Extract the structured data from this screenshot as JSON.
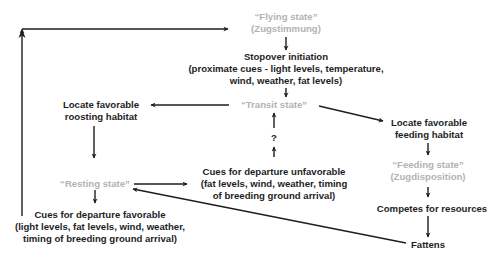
{
  "diagram": {
    "colors": {
      "text": "#1e1e1e",
      "state_text": "#b3b3b3",
      "arrow": "#1e1e1e",
      "background": "#ffffff"
    },
    "nodes": {
      "flying_state": {
        "line1": "“Flying state”",
        "line2": "(Zugstimmung)"
      },
      "stopover_initiation": {
        "line1": "Stopover initiation",
        "line2": "(proximate cues - light levels, temperature,",
        "line3": "wind, weather, fat levels)"
      },
      "transit_state": {
        "line1": "“Transit state”"
      },
      "question_mark": {
        "line1": "?"
      },
      "locate_roosting": {
        "line1": "Locate favorable",
        "line2": "roosting habitat"
      },
      "locate_feeding": {
        "line1": "Locate favorable",
        "line2": "feeding habitat"
      },
      "feeding_state": {
        "line1": "“Feeding state”",
        "line2": "(Zugdisposition)"
      },
      "resting_state": {
        "line1": "“Resting state”"
      },
      "cues_unfavorable": {
        "line1": "Cues for departure unfavorable",
        "line2": "(fat levels, wind, weather, timing",
        "line3": "of breeding ground arrival)"
      },
      "cues_favorable": {
        "line1": "Cues for departure favorable",
        "line2": "(light levels, fat levels, wind, weather,",
        "line3": "timing of breeding ground arrival)"
      },
      "competes": {
        "line1": "Competes for resources"
      },
      "fattens": {
        "line1": "Fattens"
      }
    },
    "edges": [
      {
        "from": "cues_favorable",
        "to": "flying_state",
        "route": "left-loop"
      },
      {
        "from": "flying_state",
        "to": "stopover_initiation"
      },
      {
        "from": "stopover_initiation",
        "to": "transit_state"
      },
      {
        "from": "transit_state",
        "to": "locate_roosting"
      },
      {
        "from": "transit_state",
        "to": "locate_feeding"
      },
      {
        "from": "cues_unfavorable",
        "to": "transit_state",
        "label": "?"
      },
      {
        "from": "locate_roosting",
        "to": "resting_state"
      },
      {
        "from": "resting_state",
        "to": "cues_unfavorable"
      },
      {
        "from": "resting_state",
        "to": "cues_favorable"
      },
      {
        "from": "locate_feeding",
        "to": "feeding_state"
      },
      {
        "from": "feeding_state",
        "to": "competes"
      },
      {
        "from": "competes",
        "to": "fattens"
      },
      {
        "from": "fattens",
        "to": "resting_state"
      }
    ]
  }
}
